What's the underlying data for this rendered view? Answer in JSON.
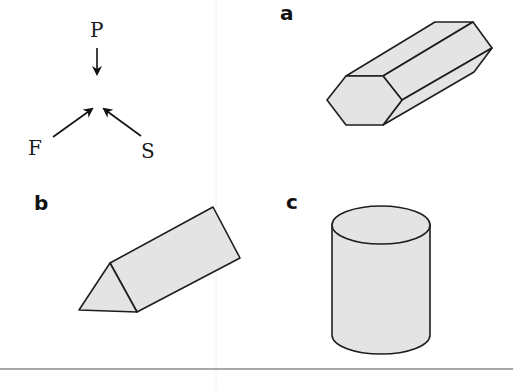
{
  "force_diagram": {
    "labels": {
      "top": "P",
      "left": "F",
      "right": "S"
    },
    "description": "Three arrows pointing to a common point"
  },
  "panels": [
    {
      "id": "a",
      "label": "a",
      "shape": "hexagonal prism"
    },
    {
      "id": "b",
      "label": "b",
      "shape": "triangular prism"
    },
    {
      "id": "c",
      "label": "c",
      "shape": "cylinder"
    }
  ],
  "colors": {
    "shape_fill": "#e4e4e4",
    "stroke": "#1e1e1e",
    "rule": "#8a8a8a",
    "divider": "#f0f0f0"
  }
}
